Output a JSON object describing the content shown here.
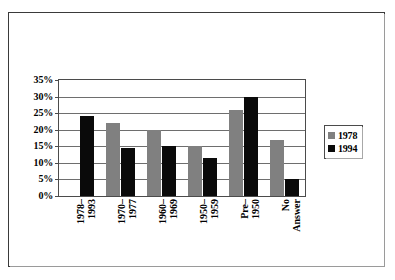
{
  "chart_data": {
    "type": "bar",
    "title": "",
    "xlabel": "",
    "ylabel": "",
    "ylim": [
      0,
      35
    ],
    "grid": true,
    "legend_position": "right",
    "categories": [
      "1978–\n1993",
      "1970–\n1977",
      "1960–\n1969",
      "1950–\n1959",
      "Pre–\n1950",
      "No\nAnswer"
    ],
    "y_ticks": [
      "0%",
      "5%",
      "10%",
      "15%",
      "20%",
      "25%",
      "30%",
      "35%"
    ],
    "y_tick_values": [
      0,
      5,
      10,
      15,
      20,
      25,
      30,
      35
    ],
    "series": [
      {
        "name": "1978",
        "color": "#808080",
        "values": [
          null,
          22,
          20,
          15,
          26,
          17
        ]
      },
      {
        "name": "1994",
        "color": "#0a0a0a",
        "values": [
          24,
          14.5,
          15,
          11.5,
          30,
          5
        ]
      }
    ]
  },
  "legend": {
    "entries": [
      {
        "label": "1978",
        "swatch": "gray-swatch-icon"
      },
      {
        "label": "1994",
        "swatch": "black-swatch-icon"
      }
    ]
  },
  "colors": {
    "series_1978": "#808080",
    "series_1994": "#0a0a0a",
    "gridline": "#6e6e6e",
    "axis": "#4b4b4b",
    "frame": "#3a3a3a",
    "background": "#ffffff"
  }
}
